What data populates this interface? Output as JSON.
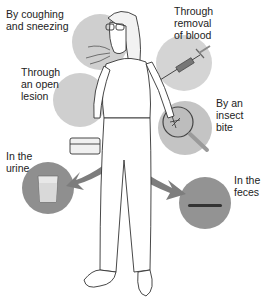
{
  "diagram": {
    "labels": {
      "cough": "By coughing\nand sneezing",
      "blood": "Through\nremoval\nof blood",
      "lesion": "Through\nan open\nlesion",
      "insect": "By an\ninsect\nbite",
      "urine": "In the\nurine",
      "feces": "In the\nfeces"
    },
    "colors": {
      "circle_light": "#c9c9c9",
      "circle_dark": "#8f8f8f",
      "arrow": "#7d7d7d",
      "line": "#333333"
    }
  }
}
